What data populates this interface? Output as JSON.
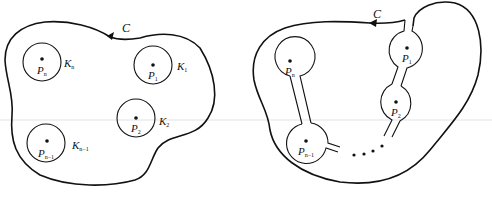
{
  "figure": {
    "left_panel": {
      "contour_label": "C",
      "disks": [
        {
          "point": "P",
          "point_sub": "n",
          "disk": "K",
          "disk_sub": "n"
        },
        {
          "point": "P",
          "point_sub": "1",
          "disk": "K",
          "disk_sub": "1"
        },
        {
          "point": "P",
          "point_sub": "2",
          "disk": "K",
          "disk_sub": "2"
        },
        {
          "point": "P",
          "point_sub": "n−1",
          "disk": "K",
          "disk_sub": "n−1"
        }
      ]
    },
    "right_panel": {
      "contour_label": "C",
      "points": [
        {
          "label": "P",
          "sub": "n"
        },
        {
          "label": "P",
          "sub": "1"
        },
        {
          "label": "P",
          "sub": "2"
        },
        {
          "label": "P",
          "sub": "n−1"
        }
      ],
      "ellipsis": "• • • •"
    },
    "colors": {
      "stroke": "#111111",
      "background": "#ffffff",
      "guide_line": "#dddddd"
    }
  }
}
